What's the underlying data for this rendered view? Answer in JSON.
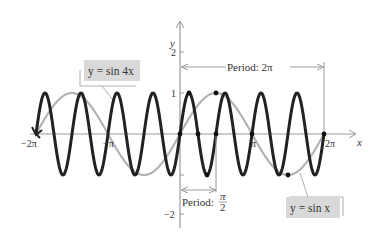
{
  "chart_data": {
    "type": "line",
    "title": "",
    "xlabel": "x",
    "ylabel": "y",
    "xlim": [
      -6.283,
      6.9
    ],
    "ylim": [
      -2.3,
      2.6
    ],
    "x_ticks": [
      {
        "value": -6.2832,
        "label": "−2π"
      },
      {
        "value": -3.1416,
        "label": "−π"
      },
      {
        "value": 3.1416,
        "label": "π"
      },
      {
        "value": 6.2832,
        "label": "2π"
      }
    ],
    "y_ticks": [
      {
        "value": 2,
        "label": "2"
      },
      {
        "value": 1,
        "label": "1"
      },
      {
        "value": -1,
        "label": ""
      },
      {
        "value": -2,
        "label": "−2"
      }
    ],
    "grid": false,
    "series": [
      {
        "name": "y = sin 4x",
        "function": "sin(4x)",
        "domain": [
          -6.2832,
          6.2832
        ],
        "color": "#222222",
        "width": 3
      },
      {
        "name": "y = sin x",
        "function": "sin(x)",
        "domain": [
          -6.2832,
          6.2832
        ],
        "color": "#b3b3b3",
        "width": 2.2
      }
    ],
    "marked_points": [
      {
        "x": 0,
        "y": 0
      },
      {
        "x": 0.3927,
        "y": 1
      },
      {
        "x": 0.7854,
        "y": 0
      },
      {
        "x": 1.1781,
        "y": -1
      },
      {
        "x": 1.5708,
        "y": 0
      },
      {
        "x": 1.5708,
        "y": 1
      },
      {
        "x": 3.1416,
        "y": 0
      },
      {
        "x": 4.7124,
        "y": -1
      },
      {
        "x": 6.2832,
        "y": 0
      }
    ],
    "annotations": [
      {
        "text": "Period: 2π",
        "from": 0,
        "to": 6.2832,
        "y": 1.6
      },
      {
        "text": "Period: π/2",
        "from": 0,
        "to": 1.5708,
        "y": -1.4
      }
    ]
  },
  "labels": {
    "y_axis": "y",
    "x_axis": "x",
    "tick_2": "2",
    "tick_1": "1",
    "tick_neg2": "−2",
    "tick_neg2pi": "−2π",
    "tick_negpi": "−π",
    "tick_pi": "π",
    "tick_2pi": "2π",
    "period_2pi_text": "Period:  2π",
    "period_pi2_text": "Period:",
    "period_pi2_num": "π",
    "period_pi2_den": "2",
    "eq_sin4x": "y = sin 4x",
    "eq_sinx": "y = sin x"
  },
  "colors": {
    "sin4x": "#222222",
    "sinx": "#b3b3b3",
    "axis": "#9a9a9a",
    "label_bg": "#d9d9d9"
  }
}
